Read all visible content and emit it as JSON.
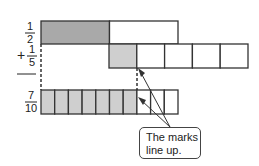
{
  "rows": [
    {
      "label_num": "1",
      "label_den": "2",
      "sign": "",
      "parts": 2,
      "shaded": 1
    },
    {
      "label_num": "1",
      "label_den": "5",
      "sign": "+",
      "parts": 5,
      "shaded": 1
    },
    {
      "label_num": "7",
      "label_den": "10",
      "sign": "",
      "parts": 10,
      "shaded": 7
    }
  ],
  "callout": {
    "line1": "The marks",
    "line2": "line up."
  },
  "colors": {
    "shade_dark": "#a9a9a9",
    "shade_light": "#cfcfcf",
    "stroke": "#333333"
  }
}
